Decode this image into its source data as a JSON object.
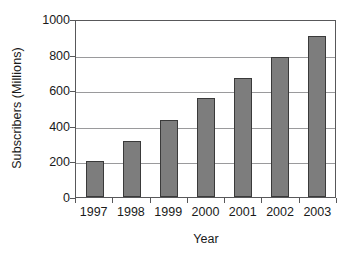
{
  "chart_data": {
    "type": "bar",
    "title": "",
    "subtitle": "",
    "xlabel": "Year",
    "ylabel": "Subscribers (Millions)",
    "categories": [
      "1997",
      "1998",
      "1999",
      "2000",
      "2001",
      "2002",
      "2003"
    ],
    "values": [
      205,
      315,
      435,
      555,
      670,
      785,
      905
    ],
    "ylim": [
      0,
      1000
    ],
    "ytick_labels": [
      "0",
      "200",
      "400",
      "600",
      "800",
      "1000"
    ],
    "ytick_values": [
      0,
      200,
      400,
      600,
      800,
      1000
    ],
    "grid": true,
    "grid_axis": "y",
    "legend": false,
    "legend_position": "none",
    "series": [
      {
        "name": "Subscribers",
        "values": [
          205,
          315,
          435,
          555,
          670,
          785,
          905
        ],
        "color": "#7d7d7d",
        "border_color": "#3a3a3a"
      }
    ],
    "colors": {
      "bar_fill": "#7d7d7d",
      "bar_border": "#3a3a3a",
      "gridline": "#9a9a9c",
      "axis": "#58585a",
      "background": "#ffffff",
      "text": "#1a1a1a"
    }
  }
}
